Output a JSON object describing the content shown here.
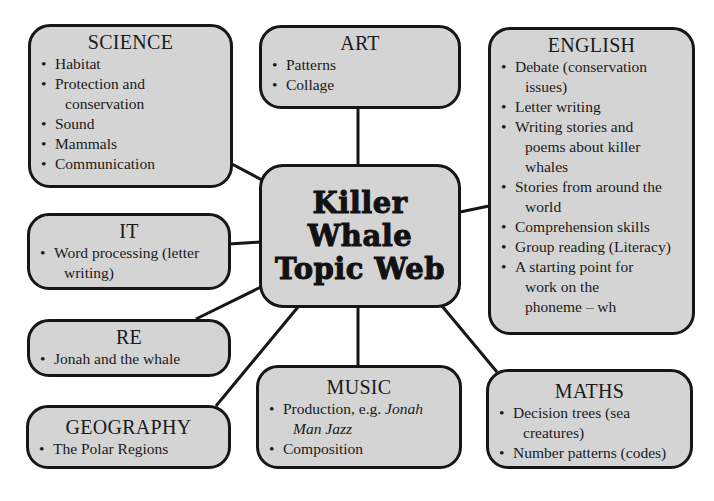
{
  "center": {
    "lines": [
      "Killer",
      "Whale",
      "Topic Web"
    ]
  },
  "colors": {
    "box_fill": "#d4d4d4",
    "border": "#161616",
    "background": "#ffffff"
  },
  "nodes": {
    "science": {
      "title": "SCIENCE",
      "items": [
        "Habitat",
        "Protection and",
        "conservation",
        "Sound",
        "Mammals",
        "Communication"
      ]
    },
    "art": {
      "title": "ART",
      "items": [
        "Patterns",
        "Collage"
      ]
    },
    "english": {
      "title": "ENGLISH",
      "items": [
        "Debate (conservation",
        "issues)",
        "Letter writing",
        "Writing stories and",
        "poems about killer",
        "whales",
        "Stories from around the",
        "world",
        "Comprehension skills",
        "Group reading (Literacy)",
        "A starting point for",
        "work on the",
        "phoneme – wh"
      ]
    },
    "it": {
      "title": "IT",
      "items": [
        "Word processing (letter",
        "writing)"
      ]
    },
    "re": {
      "title": "RE",
      "items": [
        "Jonah and the whale"
      ]
    },
    "geography": {
      "title": "GEOGRAPHY",
      "items": [
        "The Polar Regions"
      ]
    },
    "music": {
      "title": "MUSIC",
      "items": [
        "Production, e.g. ",
        "Jonah",
        "Man Jazz",
        "Composition"
      ]
    },
    "maths": {
      "title": "MATHS",
      "items": [
        "Decision trees (sea",
        "creatures)",
        "Number patterns (codes)"
      ]
    }
  }
}
